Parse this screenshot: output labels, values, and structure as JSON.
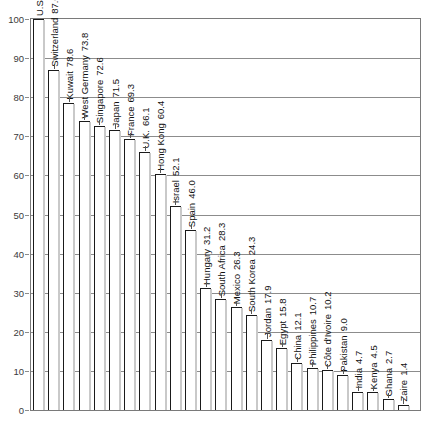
{
  "top_caption_partial": "",
  "axis": {
    "y_ticks": [
      0,
      10,
      20,
      30,
      40,
      50,
      60,
      70,
      80,
      90,
      100
    ],
    "y_min": 0,
    "y_max": 100
  },
  "chart_data": {
    "type": "bar",
    "title": "",
    "subtitle": "",
    "xlabel": "",
    "ylabel": "",
    "ylim": [
      0,
      100
    ],
    "grid": true,
    "legend": "none",
    "orientation": "vertical",
    "label_rotation": -90,
    "categories": [
      "U.S.",
      "Switzerland",
      "Kuwait",
      "West Germany",
      "Singapore",
      "Japan",
      "France",
      "U.K.",
      "Hong Kong",
      "Israel",
      "Spain",
      "Hungary",
      "South Africa",
      "Mexico",
      "South Korea",
      "Jordan",
      "Egypt",
      "China",
      "Philippines",
      "Côte d'Ivoire",
      "Pakistan",
      "India",
      "Kenya",
      "Ghana",
      "Zaire"
    ],
    "values": [
      100,
      87.0,
      78.6,
      73.8,
      72.6,
      71.5,
      69.3,
      66.1,
      60.4,
      52.1,
      46.0,
      31.2,
      28.3,
      26.3,
      24.3,
      17.9,
      15.8,
      12.1,
      10.7,
      10.2,
      9.0,
      4.7,
      4.5,
      2.7,
      1.4
    ],
    "value_labels": [
      "100",
      "87.0",
      "78.6",
      "73.8",
      "72.6",
      "71.5",
      "69.3",
      "66.1",
      "60.4",
      "52.1",
      "46.0",
      "31.2",
      "28.3",
      "26.3",
      "24.3",
      "17.9",
      "15.8",
      "12.1",
      "10.7",
      "10.2",
      "9.0",
      "4.7",
      "4.5",
      "2.7",
      "1.4"
    ]
  },
  "colors": {
    "bar_fill": "#ffffff",
    "bar_stroke": "#1a1a1a",
    "grid": "#8c8c8c",
    "frame": "#7a7a7a",
    "text": "#111111",
    "tick_text": "#3a3a3a"
  }
}
